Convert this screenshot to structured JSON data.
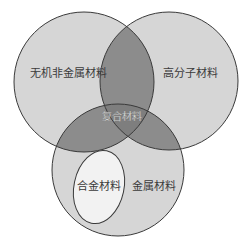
{
  "diagram": {
    "type": "venn",
    "sets": [
      {
        "id": "inorganic",
        "label": "无机非金属材料"
      },
      {
        "id": "polymer",
        "label": "高分子材料"
      },
      {
        "id": "metal",
        "label": "金属材料"
      }
    ],
    "subset": {
      "label": "合金材料",
      "parent": "metal"
    },
    "intersection": {
      "label": "复合材料"
    },
    "colors": {
      "circle_fill": "#d6d6d6",
      "overlap_fill": "#8c8c8c",
      "subset_fill": "#f2f2f2",
      "stroke": "#3a3a3a"
    }
  }
}
